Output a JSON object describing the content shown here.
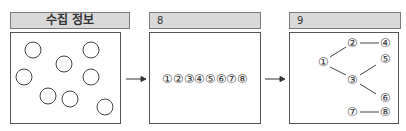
{
  "panels": [
    {
      "title": "수집 정보",
      "circle_count": 8
    },
    {
      "title": "8",
      "sequence": "①②③④⑤⑥⑦⑧"
    },
    {
      "title": "9",
      "nodes": {
        "n1": "①",
        "n2": "②",
        "n3": "③",
        "n4": "④",
        "n5": "⑤",
        "n6": "⑥",
        "n7": "⑦",
        "n8": "⑧"
      },
      "edges": [
        [
          "①",
          "②"
        ],
        [
          "②",
          "④"
        ],
        [
          "①",
          "③"
        ],
        [
          "③",
          "⑤"
        ],
        [
          "③",
          "⑥"
        ],
        [
          "⑦",
          "⑧"
        ]
      ]
    }
  ],
  "arrows": [
    "panel1-to-panel2",
    "panel2-to-panel3"
  ],
  "colors": {
    "header_bg": "#d9d9d9",
    "border": "#555555",
    "stroke": "#444444"
  }
}
